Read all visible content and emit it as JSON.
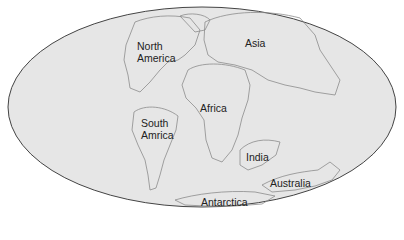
{
  "map": {
    "projection": "mollweide-ellipse",
    "background_color": "#e6e6e6",
    "outline_color": "#444444",
    "coast_color": "#8c8c8c",
    "labels": [
      {
        "id": "north-america",
        "text": "North\nAmerica",
        "x": 137,
        "y": 40
      },
      {
        "id": "asia",
        "text": "Asia",
        "x": 245,
        "y": 37
      },
      {
        "id": "africa",
        "text": "Africa",
        "x": 200,
        "y": 102
      },
      {
        "id": "south-america",
        "text": "South\nAmrica",
        "x": 141,
        "y": 117
      },
      {
        "id": "india",
        "text": "India",
        "x": 246,
        "y": 151
      },
      {
        "id": "australia",
        "text": "Australia",
        "x": 270,
        "y": 177
      },
      {
        "id": "antarctica",
        "text": "Antarctica",
        "x": 201,
        "y": 196
      }
    ]
  }
}
